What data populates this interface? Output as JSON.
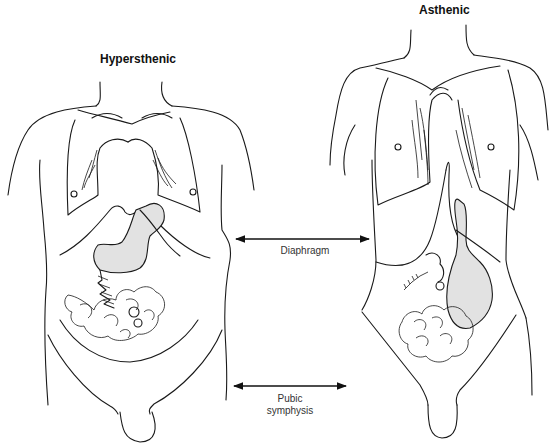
{
  "figures": {
    "left": {
      "title": "Hypersthenic"
    },
    "right": {
      "title": "Asthenic"
    }
  },
  "landmarks": {
    "diaphragm": {
      "label": "Diaphragm"
    },
    "pubic_symphysis": {
      "label_line1": "Pubic",
      "label_line2": "symphysis"
    }
  },
  "colors": {
    "organ_fill": "#e2e2e2",
    "line": "#1a1a1a",
    "background": "#ffffff"
  }
}
